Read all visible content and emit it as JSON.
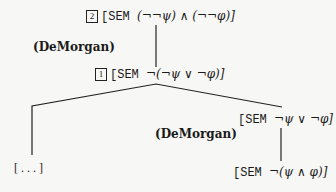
{
  "tree": {
    "root": {
      "tag": "2",
      "prefix": "[SEM ",
      "formula": "(¬¬ψ) ∧ (¬¬φ)]"
    },
    "rule_top": "(DeMorgan)",
    "node1": {
      "tag": "1",
      "prefix": "[SEM ",
      "formula": "¬(¬ψ ∨ ¬φ)]"
    },
    "left_leaf": "[ . . . ]",
    "right_node": {
      "prefix": "[SEM ",
      "formula": "¬ψ ∨ ¬φ]"
    },
    "rule_right": "(DeMorgan)",
    "right_leaf": {
      "prefix": "[SEM ",
      "formula": "¬(ψ ∧ φ)]"
    }
  }
}
